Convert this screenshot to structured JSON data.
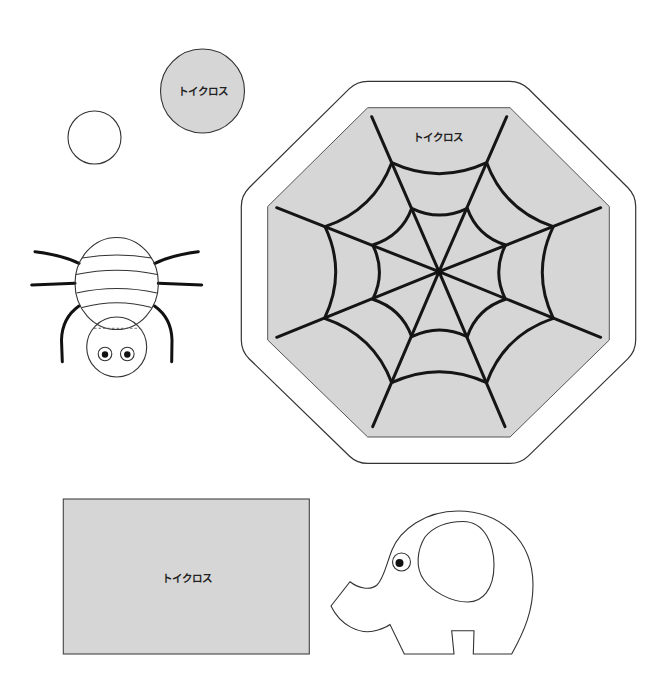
{
  "sheet": {
    "colors": {
      "background": "#ffffff",
      "card_gray": "#d6d6d6",
      "outline": "#333333",
      "web_line": "#151515",
      "label_text": "#222222"
    },
    "pieces": {
      "small_circle": {
        "icon": "circle-outline-icon"
      },
      "gray_circle": {
        "label": "トイクロス",
        "icon": "filled-circle-icon"
      },
      "spider": {
        "icon": "spider-icon"
      },
      "web_octagon": {
        "label": "トイクロス",
        "icon": "spider-web-icon"
      },
      "rectangle": {
        "label": "トイクロス",
        "icon": "rectangle-card-icon"
      },
      "elephant": {
        "icon": "elephant-icon"
      }
    }
  }
}
